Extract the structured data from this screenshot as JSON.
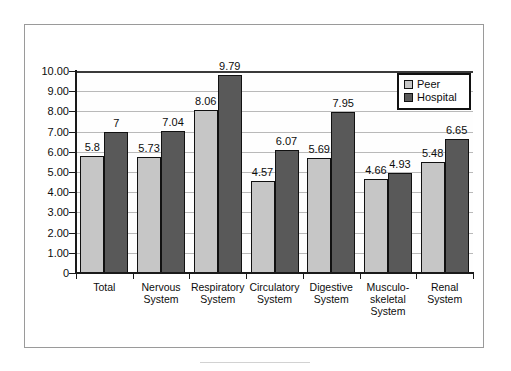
{
  "chart_data": {
    "type": "bar",
    "title": "",
    "xlabel": "",
    "ylabel": "",
    "ylim": [
      0,
      10
    ],
    "grid": true,
    "legend_position": "top-right",
    "categories": [
      "Total",
      "Nervous System",
      "Respiratory System",
      "Circulatory System",
      "Digestive System",
      "Musculo-skeletal System",
      "Renal System"
    ],
    "category_lines": [
      [
        "Total"
      ],
      [
        "Nervous",
        "System"
      ],
      [
        "Respiratory",
        "System"
      ],
      [
        "Circulatory",
        "System"
      ],
      [
        "Digestive",
        "System"
      ],
      [
        "Musculo-",
        "skeletal",
        "System"
      ],
      [
        "Renal",
        "System"
      ]
    ],
    "series": [
      {
        "name": "Peer",
        "color": "#c6c6c6",
        "values": [
          5.8,
          5.73,
          8.06,
          4.57,
          5.69,
          4.66,
          5.48
        ],
        "labels": [
          "5.8",
          "5.73",
          "8.06",
          "4.57",
          "5.69",
          "4.66",
          "5.48"
        ]
      },
      {
        "name": "Hospital",
        "color": "#595959",
        "values": [
          7,
          7.04,
          9.79,
          6.07,
          7.95,
          4.93,
          6.65
        ],
        "labels": [
          "7",
          "7.04",
          "9.79",
          "6.07",
          "7.95",
          "4.93",
          "6.65"
        ]
      }
    ],
    "y_ticks": [
      {
        "value": 10,
        "label": "10.00"
      },
      {
        "value": 9,
        "label": "9.00"
      },
      {
        "value": 8,
        "label": "8.00"
      },
      {
        "value": 7,
        "label": "7.00"
      },
      {
        "value": 6,
        "label": "6.00"
      },
      {
        "value": 5,
        "label": "5.00"
      },
      {
        "value": 4,
        "label": "4.00"
      },
      {
        "value": 3,
        "label": "3.00"
      },
      {
        "value": 2,
        "label": "2.00"
      },
      {
        "value": 1,
        "label": "1.00"
      },
      {
        "value": 0,
        "label": "0"
      }
    ]
  },
  "legend": {
    "items": [
      {
        "label": "Peer",
        "swatch": "peer"
      },
      {
        "label": "Hospital",
        "swatch": "hospital"
      }
    ]
  }
}
